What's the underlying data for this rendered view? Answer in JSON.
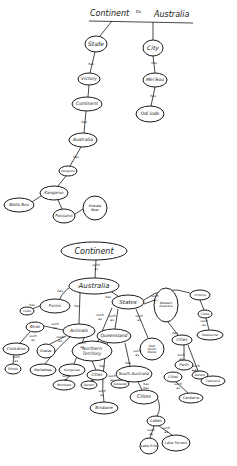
{
  "top_map": {
    "title_left": "Continent",
    "title_mid": "Ex.",
    "title_right": "Australia",
    "nodes": [
      {
        "id": "state",
        "label": "State",
        "x": 96,
        "y": 44,
        "rx": 11,
        "ry": 8,
        "fs": 6
      },
      {
        "id": "city",
        "label": "City",
        "x": 153,
        "y": 48,
        "rx": 10,
        "ry": 8,
        "fs": 6
      },
      {
        "id": "victory",
        "label": "Victory",
        "x": 89,
        "y": 79,
        "rx": 11,
        "ry": 6,
        "fs": 4.5
      },
      {
        "id": "melbou",
        "label": "Mel Bou",
        "x": 155,
        "y": 80,
        "rx": 12,
        "ry": 7,
        "fs": 4.5
      },
      {
        "id": "continent2",
        "label": "Continent",
        "x": 87,
        "y": 104,
        "rx": 15,
        "ry": 7,
        "fs": 4.5
      },
      {
        "id": "odilode",
        "label": "Odi lode",
        "x": 150,
        "y": 114,
        "rx": 14,
        "ry": 8,
        "fs": 4.5
      },
      {
        "id": "australia",
        "label": "Australia",
        "x": 83,
        "y": 140,
        "rx": 14,
        "ry": 7,
        "fs": 4.5
      },
      {
        "id": "penguins",
        "label": "Penguins",
        "x": 68,
        "y": 171,
        "rx": 9,
        "ry": 5,
        "fs": 3
      },
      {
        "id": "kangaroo",
        "label": "Kangaroo",
        "x": 54,
        "y": 193,
        "rx": 14,
        "ry": 7,
        "fs": 4
      },
      {
        "id": "wallaboo",
        "label": "Walla Boo",
        "x": 19,
        "y": 205,
        "rx": 15,
        "ry": 7,
        "fs": 4
      },
      {
        "id": "possums",
        "label": "Possums",
        "x": 64,
        "y": 216,
        "rx": 11,
        "ry": 7,
        "fs": 4
      },
      {
        "id": "koala",
        "label": "Kowala Bear",
        "x": 95,
        "y": 208,
        "rx": 12,
        "ry": 12,
        "fs": 3.5
      }
    ],
    "edge_labels": [
      {
        "text": "has",
        "x": 91,
        "y": 64
      },
      {
        "text": "has",
        "x": 154,
        "y": 63
      },
      {
        "text": "has",
        "x": 153,
        "y": 96
      },
      {
        "text": "has",
        "x": 84,
        "y": 122
      },
      {
        "text": "has",
        "x": 76,
        "y": 157
      }
    ]
  },
  "bottom_map": {
    "nodes": [
      {
        "id": "continent",
        "label": "Continent",
        "x": 94,
        "y": 251,
        "rx": 33,
        "ry": 9,
        "fs": 8
      },
      {
        "id": "australia",
        "label": "Australia",
        "x": 94,
        "y": 286,
        "rx": 25,
        "ry": 8,
        "fs": 7
      },
      {
        "id": "forms",
        "label": "Forms",
        "x": 55,
        "y": 306,
        "rx": 15,
        "ry": 7,
        "fs": 4
      },
      {
        "id": "states",
        "label": "States",
        "x": 128,
        "y": 302,
        "rx": 16,
        "ry": 7,
        "fs": 5.5
      },
      {
        "id": "cows",
        "label": "Cows",
        "x": 27,
        "y": 311,
        "rx": 7,
        "ry": 4,
        "fs": 3
      },
      {
        "id": "birds",
        "label": "Birds",
        "x": 35,
        "y": 327,
        "rx": 9,
        "ry": 5,
        "fs": 4
      },
      {
        "id": "animals",
        "label": "Animals",
        "x": 79,
        "y": 331,
        "rx": 16,
        "ry": 7,
        "fs": 4.5
      },
      {
        "id": "queensland",
        "label": "Queensland",
        "x": 114,
        "y": 336,
        "rx": 17,
        "ry": 7,
        "fs": 4.5
      },
      {
        "id": "westaus",
        "label": "Western Australia",
        "x": 166,
        "y": 305,
        "rx": 12,
        "ry": 17,
        "fs": 3
      },
      {
        "id": "victoria",
        "label": "Victoria",
        "x": 200,
        "y": 295,
        "rx": 10,
        "ry": 5,
        "fs": 3
      },
      {
        "id": "cities_v",
        "label": "Cities",
        "x": 205,
        "y": 314,
        "rx": 7,
        "ry": 4,
        "fs": 3
      },
      {
        "id": "melbourne",
        "label": "Melbourne",
        "x": 210,
        "y": 335,
        "rx": 13,
        "ry": 5,
        "fs": 3
      },
      {
        "id": "cities_w",
        "label": "Cities",
        "x": 182,
        "y": 340,
        "rx": 10,
        "ry": 5,
        "fs": 4
      },
      {
        "id": "cockatoo",
        "label": "Cockatoo",
        "x": 16,
        "y": 349,
        "rx": 13,
        "ry": 6,
        "fs": 4
      },
      {
        "id": "koalas",
        "label": "Koalas",
        "x": 46,
        "y": 351,
        "rx": 9,
        "ry": 7,
        "fs": 3.5
      },
      {
        "id": "northern",
        "label": "Northern Territory",
        "x": 92,
        "y": 351,
        "rx": 20,
        "ry": 10,
        "fs": 4.5
      },
      {
        "id": "nsw",
        "label": "New South Wales",
        "x": 152,
        "y": 349,
        "rx": 12,
        "ry": 11,
        "fs": 3
      },
      {
        "id": "perth",
        "label": "Perth",
        "x": 184,
        "y": 365,
        "rx": 9,
        "ry": 5,
        "fs": 3.5
      },
      {
        "id": "cities_n",
        "label": "Cities",
        "x": 173,
        "y": 377,
        "rx": 9,
        "ry": 5,
        "fs": 3.5
      },
      {
        "id": "darwin",
        "label": "Darwin",
        "x": 200,
        "y": 375,
        "rx": 8,
        "ry": 4,
        "fs": 3
      },
      {
        "id": "tasmania",
        "label": "Tasmania",
        "x": 213,
        "y": 381,
        "rx": 12,
        "ry": 5,
        "fs": 3
      },
      {
        "id": "emus",
        "label": "Emus",
        "x": 13,
        "y": 369,
        "rx": 8,
        "ry": 5,
        "fs": 3.5
      },
      {
        "id": "wallabees",
        "label": "Wallabees",
        "x": 43,
        "y": 370,
        "rx": 13,
        "ry": 6,
        "fs": 3.5
      },
      {
        "id": "kangaroos",
        "label": "Kangaroos",
        "x": 72,
        "y": 370,
        "rx": 13,
        "ry": 6,
        "fs": 3
      },
      {
        "id": "cities_nt",
        "label": "Cities",
        "x": 97,
        "y": 375,
        "rx": 10,
        "ry": 5,
        "fs": 4
      },
      {
        "id": "southaus",
        "label": "South Australia",
        "x": 134,
        "y": 374,
        "rx": 18,
        "ry": 8,
        "fs": 4
      },
      {
        "id": "wombats",
        "label": "Wombats",
        "x": 64,
        "y": 385,
        "rx": 11,
        "ry": 5,
        "fs": 3
      },
      {
        "id": "darwin2",
        "label": "Darwin",
        "x": 89,
        "y": 385,
        "rx": 8,
        "ry": 4,
        "fs": 3
      },
      {
        "id": "adelaide",
        "label": "Adelaide",
        "x": 120,
        "y": 384,
        "rx": 9,
        "ry": 4,
        "fs": 3
      },
      {
        "id": "canberra",
        "label": "Canberra",
        "x": 191,
        "y": 398,
        "rx": 12,
        "ry": 5,
        "fs": 3.5
      },
      {
        "id": "brisbane",
        "label": "Brisbane",
        "x": 104,
        "y": 408,
        "rx": 14,
        "ry": 6,
        "fs": 4
      },
      {
        "id": "cities_s",
        "label": "Cities",
        "x": 144,
        "y": 397,
        "rx": 14,
        "ry": 7,
        "fs": 5
      },
      {
        "id": "lakes",
        "label": "Lakes",
        "x": 156,
        "y": 421,
        "rx": 9,
        "ry": 5,
        "fs": 4
      },
      {
        "id": "lakeerie",
        "label": "Lake Erie",
        "x": 149,
        "y": 446,
        "rx": 9,
        "ry": 8,
        "fs": 3.5
      },
      {
        "id": "laketorrens",
        "label": "Lake Torrens",
        "x": 176,
        "y": 443,
        "rx": 14,
        "ry": 8,
        "fs": 3.5
      }
    ],
    "edge_labels": [
      {
        "text": "such as",
        "x": 96,
        "y": 267
      },
      {
        "text": "has",
        "x": 60,
        "y": 291
      },
      {
        "text": "has",
        "x": 108,
        "y": 297
      },
      {
        "text": "such as",
        "x": 155,
        "y": 298
      },
      {
        "text": "has",
        "x": 32,
        "y": 305
      },
      {
        "text": "such as",
        "x": 33,
        "y": 338
      },
      {
        "text": "has",
        "x": 77,
        "y": 306
      },
      {
        "text": "such as",
        "x": 55,
        "y": 326
      },
      {
        "text": "such as",
        "x": 100,
        "y": 317
      },
      {
        "text": "such as",
        "x": 112,
        "y": 318
      },
      {
        "text": "such as",
        "x": 139,
        "y": 318
      },
      {
        "text": "such as",
        "x": 204,
        "y": 323
      },
      {
        "text": "has",
        "x": 175,
        "y": 333
      },
      {
        "text": "such as",
        "x": 16,
        "y": 359
      },
      {
        "text": "such as",
        "x": 60,
        "y": 339
      },
      {
        "text": "such as",
        "x": 82,
        "y": 345
      },
      {
        "text": "such as",
        "x": 137,
        "y": 353
      },
      {
        "text": "has",
        "x": 128,
        "y": 363
      },
      {
        "text": "has",
        "x": 102,
        "y": 366
      },
      {
        "text": "such as",
        "x": 181,
        "y": 357
      },
      {
        "text": "such as",
        "x": 196,
        "y": 368
      },
      {
        "text": "such as",
        "x": 178,
        "y": 386
      },
      {
        "text": "such as",
        "x": 66,
        "y": 378
      },
      {
        "text": "such as",
        "x": 102,
        "y": 393
      },
      {
        "text": "such as",
        "x": 112,
        "y": 378
      },
      {
        "text": "has has",
        "x": 146,
        "y": 386
      },
      {
        "text": "such as",
        "x": 151,
        "y": 432
      },
      {
        "text": "such as",
        "x": 166,
        "y": 430
      }
    ]
  }
}
